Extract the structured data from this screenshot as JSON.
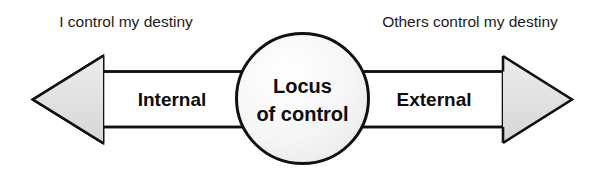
{
  "diagram": {
    "title_present": false,
    "type": "double-headed-arrow-continuum",
    "center_node": {
      "name": "locus-of-control",
      "line1": "Locus",
      "line2": "of control",
      "shape": "ellipse",
      "fill_color": "#f7f7f7",
      "stroke_color": "#111111"
    },
    "poles": [
      {
        "id": "internal",
        "side": "left",
        "band_label": "Internal",
        "caption": "I control my destiny",
        "arrow_direction": "left",
        "fill_color": "#e3e3e3",
        "stroke_color": "#111111"
      },
      {
        "id": "external",
        "side": "right",
        "band_label": "External",
        "caption": "Others control my destiny",
        "arrow_direction": "right",
        "fill_color": "#e3e3e3",
        "stroke_color": "#111111"
      }
    ],
    "colors": {
      "background": "#ffffff",
      "arrow_fill": "#e3e3e3",
      "shaft_fill": "#ffffff",
      "ellipse_fill": "#f7f7f7",
      "outline": "#111111",
      "text": "#1b1b1b"
    }
  }
}
